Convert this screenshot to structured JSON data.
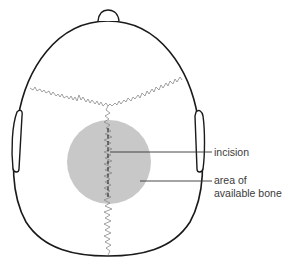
{
  "diagram": {
    "type": "anatomical illustration",
    "labels": {
      "incision": "incision",
      "bone_line1": "area of",
      "bone_line2": "available bone"
    },
    "colors": {
      "outline": "#1a1a1a",
      "suture": "#8a8a8a",
      "bone_area": "#c8c8c8",
      "leader": "#333333",
      "text": "#3a3a3a"
    }
  }
}
